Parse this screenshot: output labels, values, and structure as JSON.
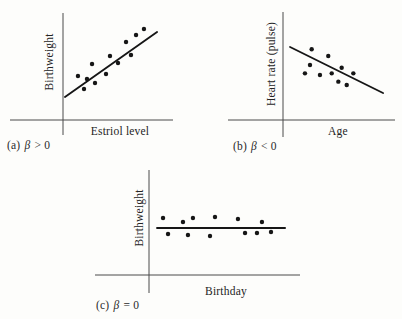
{
  "figure": {
    "background": "#fdfdfb",
    "ink_color": "#161616",
    "axis_color": "#4a4a4a"
  },
  "chart_data": [
    {
      "id": "a",
      "type": "scatter",
      "caption": "(a) β > 0",
      "caption_parts": [
        "(a) ",
        "β",
        " > 0"
      ],
      "xlabel": "Estriol level",
      "ylabel": "Birthweight",
      "slope_sign": "positive",
      "grid": false,
      "x_range": [
        0,
        1
      ],
      "y_range": [
        0,
        1
      ],
      "points": [
        [
          0.136,
          0.411
        ],
        [
          0.191,
          0.29
        ],
        [
          0.218,
          0.383
        ],
        [
          0.264,
          0.523
        ],
        [
          0.291,
          0.346
        ],
        [
          0.391,
          0.43
        ],
        [
          0.427,
          0.598
        ],
        [
          0.5,
          0.533
        ],
        [
          0.573,
          0.729
        ],
        [
          0.618,
          0.607
        ],
        [
          0.664,
          0.794
        ],
        [
          0.736,
          0.85
        ]
      ],
      "trend_line": {
        "x1": 0.018,
        "y1": 0.215,
        "x2": 0.855,
        "y2": 0.822
      }
    },
    {
      "id": "b",
      "type": "scatter",
      "caption": "(b) β < 0",
      "caption_parts": [
        "(b) ",
        "β",
        " < 0"
      ],
      "xlabel": "Age",
      "ylabel": "Heart rate (pulse)",
      "slope_sign": "negative",
      "grid": false,
      "x_range": [
        0,
        1
      ],
      "y_range": [
        0,
        1
      ],
      "points": [
        [
          0.196,
          0.432
        ],
        [
          0.241,
          0.509
        ],
        [
          0.256,
          0.655
        ],
        [
          0.33,
          0.417
        ],
        [
          0.404,
          0.593
        ],
        [
          0.435,
          0.432
        ],
        [
          0.494,
          0.355
        ],
        [
          0.524,
          0.484
        ],
        [
          0.569,
          0.324
        ],
        [
          0.628,
          0.432
        ]
      ],
      "trend_line": {
        "x1": 0.063,
        "y1": 0.676,
        "x2": 0.893,
        "y2": 0.25
      }
    },
    {
      "id": "c",
      "type": "scatter",
      "caption": "(c) β = 0",
      "caption_parts": [
        "(c) ",
        "β",
        " = 0"
      ],
      "xlabel": "Birthday",
      "ylabel": "Birthweight",
      "slope_sign": "zero",
      "grid": false,
      "x_range": [
        0,
        1
      ],
      "y_range": [
        0,
        1
      ],
      "points": [
        [
          0.093,
          0.543
        ],
        [
          0.126,
          0.39
        ],
        [
          0.225,
          0.505
        ],
        [
          0.258,
          0.381
        ],
        [
          0.291,
          0.543
        ],
        [
          0.404,
          0.371
        ],
        [
          0.437,
          0.552
        ],
        [
          0.589,
          0.533
        ],
        [
          0.636,
          0.4
        ],
        [
          0.715,
          0.4
        ],
        [
          0.748,
          0.505
        ],
        [
          0.808,
          0.41
        ]
      ],
      "trend_line": {
        "x1": 0.053,
        "y1": 0.448,
        "x2": 0.901,
        "y2": 0.448
      }
    }
  ]
}
